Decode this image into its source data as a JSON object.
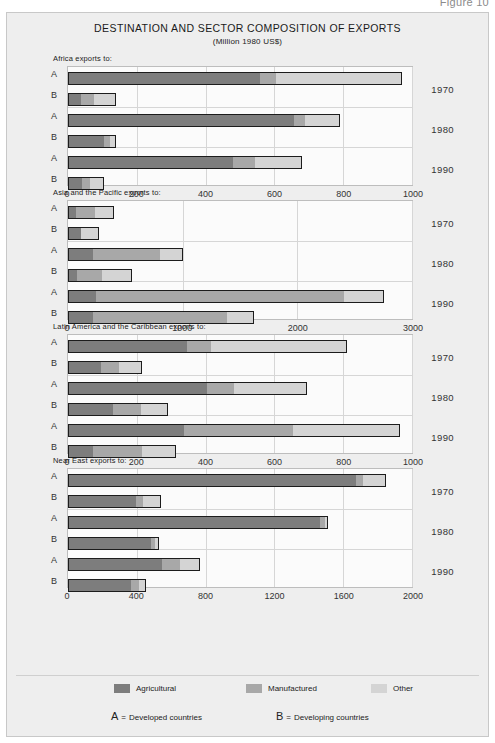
{
  "figure_label": "Figure 10",
  "title": "DESTINATION AND SECTOR COMPOSITION OF EXPORTS",
  "subtitle": "(Million 1980 US$)",
  "legend": {
    "series": [
      {
        "label": "Agricultural",
        "color": "#7d7d7d"
      },
      {
        "label": "Manufactured",
        "color": "#a8a8a8"
      },
      {
        "label": "Other",
        "color": "#d4d4d4"
      }
    ],
    "definitions": [
      {
        "key": "A",
        "equals": "=",
        "text": "Developed countries"
      },
      {
        "key": "B",
        "equals": "=",
        "text": "Developing countries"
      }
    ]
  },
  "row_labels": [
    "A",
    "B"
  ],
  "years": [
    "1970",
    "1980",
    "1990"
  ],
  "chart_data": [
    {
      "type": "bar",
      "orientation": "horizontal",
      "stacked": true,
      "title": "Africa exports to:",
      "xlabel": "",
      "ylabel": "",
      "xlim": [
        0,
        1000
      ],
      "ticks": [
        0,
        200,
        400,
        600,
        800,
        1000
      ],
      "tick_labels": [
        "0",
        "200",
        "400",
        "600",
        "800",
        "1000"
      ],
      "grid": true,
      "categories": [
        "1970 A",
        "1970 B",
        "1980 A",
        "1980 B",
        "1990 A",
        "1990 B"
      ],
      "series": [
        {
          "name": "Agricultural",
          "values": [
            560,
            35,
            660,
            105,
            480,
            40
          ]
        },
        {
          "name": "Manufactured",
          "values": [
            45,
            40,
            30,
            20,
            65,
            25
          ]
        },
        {
          "name": "Other",
          "values": [
            365,
            65,
            100,
            15,
            135,
            40
          ]
        }
      ],
      "totals": [
        970,
        140,
        790,
        140,
        680,
        105
      ]
    },
    {
      "type": "bar",
      "orientation": "horizontal",
      "stacked": true,
      "title": "Asia and the Pacific exports to:",
      "xlabel": "",
      "ylabel": "",
      "xlim": [
        0,
        3000
      ],
      "ticks": [
        0,
        1000,
        2000,
        3000
      ],
      "tick_labels": [
        "0",
        "1000",
        "2000",
        "3000"
      ],
      "grid": true,
      "categories": [
        "1970 A",
        "1970 B",
        "1980 A",
        "1980 B",
        "1990 A",
        "1990 B"
      ],
      "series": [
        {
          "name": "Agricultural",
          "values": [
            60,
            110,
            210,
            70,
            240,
            215
          ]
        },
        {
          "name": "Manufactured",
          "values": [
            180,
            0,
            600,
            230,
            2170,
            1180
          ]
        },
        {
          "name": "Other",
          "values": [
            165,
            160,
            190,
            255,
            345,
            230
          ]
        }
      ],
      "totals": [
        405,
        270,
        1000,
        555,
        2755,
        1625
      ]
    },
    {
      "type": "bar",
      "orientation": "horizontal",
      "stacked": true,
      "title": "Latin America and the Caribbean exports to:",
      "xlabel": "",
      "ylabel": "",
      "xlim": [
        0,
        1000
      ],
      "ticks": [
        0,
        200,
        400,
        600,
        800,
        1000
      ],
      "tick_labels": [
        "0",
        "200",
        "400",
        "600",
        "800",
        "1000"
      ],
      "grid": true,
      "categories": [
        "1970 A",
        "1970 B",
        "1980 A",
        "1980 B",
        "1990 A",
        "1990 B"
      ],
      "series": [
        {
          "name": "Agricultural",
          "values": [
            345,
            95,
            405,
            130,
            335,
            70
          ]
        },
        {
          "name": "Manufactured",
          "values": [
            70,
            55,
            80,
            85,
            320,
            145
          ]
        },
        {
          "name": "Other",
          "values": [
            395,
            65,
            210,
            75,
            310,
            100
          ]
        }
      ],
      "totals": [
        810,
        215,
        695,
        290,
        965,
        315
      ]
    },
    {
      "type": "bar",
      "orientation": "horizontal",
      "stacked": true,
      "title": "Near East exports to:",
      "xlabel": "",
      "ylabel": "",
      "xlim": [
        0,
        2000
      ],
      "ticks": [
        0,
        400,
        800,
        1200,
        1600,
        2000
      ],
      "tick_labels": [
        "0",
        "400",
        "800",
        "1200",
        "1600",
        "2000"
      ],
      "grid": true,
      "categories": [
        "1970 A",
        "1970 B",
        "1980 A",
        "1980 B",
        "1990 A",
        "1990 B"
      ],
      "series": [
        {
          "name": "Agricultural",
          "values": [
            1680,
            400,
            1470,
            490,
            550,
            370
          ]
        },
        {
          "name": "Manufactured",
          "values": [
            40,
            40,
            30,
            20,
            105,
            50
          ]
        },
        {
          "name": "Other",
          "values": [
            130,
            100,
            10,
            20,
            110,
            35
          ]
        }
      ],
      "totals": [
        1850,
        540,
        1510,
        530,
        765,
        455
      ]
    }
  ]
}
